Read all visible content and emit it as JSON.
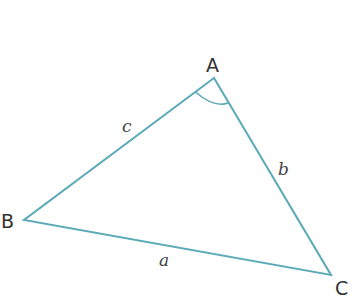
{
  "diagram": {
    "type": "triangle",
    "stroke_color": "#5aaab8",
    "vertices": {
      "A": {
        "label": "A",
        "x": 214,
        "y": 78
      },
      "B": {
        "label": "B",
        "x": 24,
        "y": 220
      },
      "C": {
        "label": "C",
        "x": 331,
        "y": 275
      }
    },
    "sides": {
      "a": {
        "label": "a",
        "between": "B-C"
      },
      "b": {
        "label": "b",
        "between": "A-C"
      },
      "c": {
        "label": "c",
        "between": "A-B"
      }
    },
    "angle_marker": {
      "at": "A"
    }
  }
}
